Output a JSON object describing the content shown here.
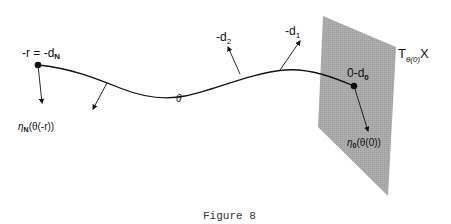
{
  "figure": {
    "caption": "Figure 8",
    "plane_label": {
      "main": "T",
      "sub": "θ(0)",
      "tail": "X"
    },
    "left_point_label": {
      "main": "-r = -d",
      "sub": "N"
    },
    "right_point_label": {
      "main": "0-d",
      "sub": "0"
    },
    "curve_label": "θ",
    "vector_labels": [
      {
        "main": "-d",
        "sub": "2"
      },
      {
        "main": "-d",
        "sub": "1"
      }
    ],
    "eta_left": {
      "main": "η",
      "sub": "N",
      "tail": "(θ(-r))"
    },
    "eta_right": {
      "main": "η",
      "sub": "0",
      "tail": "(θ(0))"
    },
    "colors": {
      "plane": "#a9a9a9",
      "ink": "#111111"
    }
  }
}
